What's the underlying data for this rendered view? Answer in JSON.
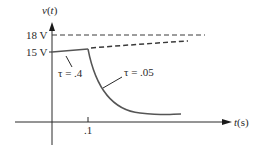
{
  "diagram": {
    "type": "voltage-time-response",
    "y_axis_label": {
      "fn": "v",
      "arg": "t"
    },
    "x_axis_label": {
      "fn": "t",
      "unit": "(s)"
    },
    "y_ticks": [
      {
        "label": "18 V",
        "value": 18
      },
      {
        "label": "15 V",
        "value": 15
      }
    ],
    "x_ticks": [
      {
        "label": ".1",
        "value": 0.1
      }
    ],
    "annotations": [
      {
        "label": "τ = .4",
        "tau": 0.4
      },
      {
        "label": "τ = .05",
        "tau": 0.05
      }
    ],
    "curves": [
      {
        "name": "18V asymptote",
        "style": "dashed"
      },
      {
        "name": "charging continuation",
        "style": "dashed"
      },
      {
        "name": "charging segment tau 0.4",
        "style": "solid"
      },
      {
        "name": "discharge tau 0.05",
        "style": "solid"
      }
    ],
    "colors": {
      "axis": "#2a2a2a",
      "curve": "#555555",
      "dashed": "#3a3a3a"
    }
  }
}
